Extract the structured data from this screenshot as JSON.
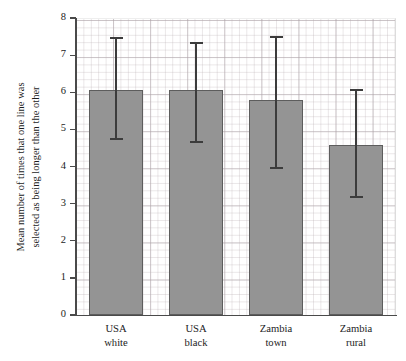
{
  "chart_data": {
    "type": "bar",
    "title": "",
    "subtitle": "",
    "xlabel": "",
    "ylabel": "Mean number of times that one line was selected as being longer than the other",
    "ylabel_lines": [
      "Mean number of times that one line was",
      "selected as being longer than the other"
    ],
    "categories": [
      "USA white",
      "USA black",
      "Zambia town",
      "Zambia rural"
    ],
    "category_lines": [
      [
        "USA",
        "white"
      ],
      [
        "USA",
        "black"
      ],
      [
        "Zambia",
        "town"
      ],
      [
        "Zambia",
        "rural"
      ]
    ],
    "values": [
      6.05,
      6.05,
      5.8,
      4.57
    ],
    "errors_upper": [
      7.46,
      7.32,
      7.49,
      6.05
    ],
    "errors_lower": [
      4.73,
      4.65,
      3.97,
      3.19
    ],
    "ylim": [
      0,
      8
    ],
    "yticks": [
      0,
      1,
      2,
      3,
      4,
      5,
      6,
      7,
      8
    ],
    "ytick_labels": [
      "0",
      "1",
      "2",
      "3",
      "4",
      "5",
      "6",
      "7",
      "8"
    ],
    "grid": true,
    "grid_minor": true,
    "legend": false,
    "legend_position": "none",
    "bar_color": "#949494",
    "bar_edge_color": "#5d5d5d",
    "error_color": "#3c3c3c",
    "axis_color": "#4a4a4a",
    "grid_color": "#968a91",
    "background_color": "#ffffff"
  }
}
